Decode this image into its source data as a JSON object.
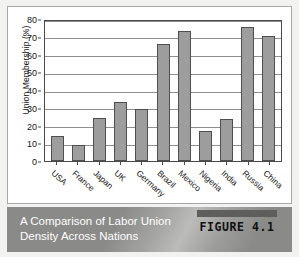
{
  "figure": {
    "caption_line_1": "A Comparison of Labor Union",
    "caption_line_2": "Density Across Nations",
    "tag_label": "FIGURE 4.1"
  },
  "colors": {
    "bar_fill": "#9d9d9d",
    "bar_stroke": "#4f4f4f",
    "gridline": "#8e8e8e",
    "axis": "#4a4a4a",
    "caption_band": "#8a8a88",
    "caption_text": "#ffffff",
    "page_background": "#f2f2f0",
    "card_background": "#ffffff"
  },
  "chart_data": {
    "type": "bar",
    "title": "",
    "xlabel": "",
    "ylabel": "Union Membership (%)",
    "ylim": [
      0,
      80
    ],
    "yticks": [
      0,
      10,
      20,
      30,
      40,
      50,
      60,
      70,
      80
    ],
    "ytick_labels": [
      "0",
      "10",
      "20",
      "30",
      "40",
      "50",
      "60",
      "70",
      "80"
    ],
    "grid": true,
    "legend": false,
    "categories": [
      "USA",
      "France",
      "Japan",
      "UK",
      "Germany",
      "Brazil",
      "Mexico",
      "Nigeria",
      "India",
      "Russia",
      "China"
    ],
    "values": [
      14,
      9,
      24.5,
      33,
      29.5,
      66,
      73,
      17,
      23.5,
      75.5,
      70.5
    ]
  }
}
